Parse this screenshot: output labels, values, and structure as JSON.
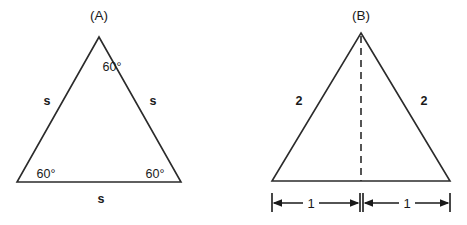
{
  "figure": {
    "background_color": "#ffffff",
    "stroke_color": "#2b2b2b",
    "text_color": "#1a1a1a",
    "panels": [
      {
        "id": "panel-a",
        "title": "(A)",
        "shape": "equilateral-triangle",
        "angle_labels": [
          {
            "name": "apex-angle",
            "text": "60°"
          },
          {
            "name": "bottom-left-angle",
            "text": "60°"
          },
          {
            "name": "bottom-right-angle",
            "text": "60°"
          }
        ],
        "side_labels": [
          {
            "name": "left-side",
            "text": "s"
          },
          {
            "name": "right-side",
            "text": "s"
          },
          {
            "name": "base-side",
            "text": "s"
          }
        ]
      },
      {
        "id": "panel-b",
        "title": "(B)",
        "shape": "equilateral-triangle-with-altitude",
        "has_dashed_altitude": true,
        "side_labels": [
          {
            "name": "left-side",
            "text": "2"
          },
          {
            "name": "right-side",
            "text": "2"
          }
        ],
        "dimensions": [
          {
            "name": "left-half-base",
            "text": "1"
          },
          {
            "name": "right-half-base",
            "text": "1"
          }
        ]
      }
    ]
  }
}
